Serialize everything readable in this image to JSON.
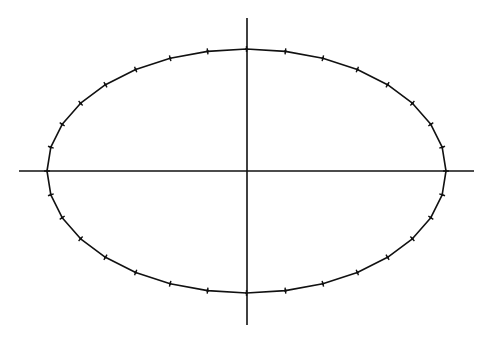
{
  "figure": {
    "width": 491,
    "height": 339,
    "background": "#ffffff",
    "stroke_color": "#111111"
  },
  "axes": {
    "horizontal": {
      "x1": 19,
      "x2": 474,
      "y": 171
    },
    "vertical": {
      "x": 247,
      "y1": 18,
      "y2": 325
    },
    "stroke_width": 1.6
  },
  "ellipse": {
    "cx": 246.5,
    "cy": 171,
    "rx": 199.5,
    "ry": 122,
    "segments": 32,
    "stroke_width": 1.6,
    "marker": "plus-tick",
    "marker_size": 3
  }
}
